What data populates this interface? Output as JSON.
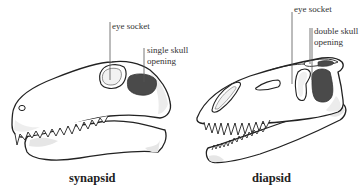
{
  "diagram": {
    "colors": {
      "outline": "#222222",
      "bone": "#ffffff",
      "shade": "#e6e6e6",
      "opening": "#4a4a4a",
      "leader": "#555555",
      "text": "#333333"
    },
    "skulls": [
      {
        "id": "synapsid",
        "caption": "synapsid",
        "labels": {
          "eye_socket": "eye socket",
          "opening_line1": "single skull",
          "opening_line2": "opening"
        }
      },
      {
        "id": "diapsid",
        "caption": "diapsid",
        "labels": {
          "eye_socket": "eye socket",
          "opening_line1": "double skull",
          "opening_line2": "opening"
        }
      }
    ]
  }
}
